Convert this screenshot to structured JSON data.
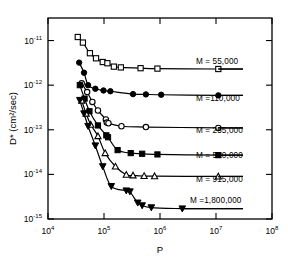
{
  "chart_data": {
    "type": "line",
    "title": "",
    "xlabel": "P",
    "ylabel": "D* (cm2/sec)",
    "ylabel_display": "D* (cm²/sec)",
    "xscale": "log",
    "yscale": "log",
    "xlim": [
      10000,
      100000000
    ],
    "ylim": [
      1e-15,
      3.2e-11
    ],
    "grid": false,
    "legend_position": "inline-right",
    "xticks": [
      {
        "value": 10000,
        "label": "10",
        "exponent": "4"
      },
      {
        "value": 100000,
        "label": "10",
        "exponent": "5"
      },
      {
        "value": 1000000,
        "label": "10",
        "exponent": "6"
      },
      {
        "value": 10000000,
        "label": "10",
        "exponent": "7"
      },
      {
        "value": 100000000,
        "label": "10",
        "exponent": "8"
      }
    ],
    "yticks": [
      {
        "value": 1e-11,
        "label": "10",
        "exponent": "-11"
      },
      {
        "value": 1e-12,
        "label": "10",
        "exponent": "-12"
      },
      {
        "value": 1e-13,
        "label": "10",
        "exponent": "-13"
      },
      {
        "value": 1e-14,
        "label": "10",
        "exponent": "-14"
      },
      {
        "value": 1e-15,
        "label": "10",
        "exponent": "-15"
      }
    ],
    "series": [
      {
        "name": "M = 55,000",
        "label": "M = 55,000",
        "marker": "square-open",
        "plateau": 2.3e-12,
        "label_x": 196,
        "label_y": 64,
        "leader_x1": 185,
        "leader_x2": 243,
        "leader_y": 72,
        "points": [
          {
            "x": 34000,
            "y": 1.2e-11
          },
          {
            "x": 42000,
            "y": 9e-12
          },
          {
            "x": 56000,
            "y": 5.2e-12
          },
          {
            "x": 72000,
            "y": 4e-12
          },
          {
            "x": 95000,
            "y": 3.3e-12
          },
          {
            "x": 115000,
            "y": 3.1e-12
          },
          {
            "x": 150000,
            "y": 2.6e-12
          },
          {
            "x": 200000,
            "y": 2.5e-12
          },
          {
            "x": 450000,
            "y": 2.4e-12
          },
          {
            "x": 900000,
            "y": 2.35e-12
          },
          {
            "x": 11000000,
            "y": 2.3e-12
          }
        ]
      },
      {
        "name": "M = 110,000",
        "label": "M =110,000",
        "marker": "circle-solid",
        "plateau": 6e-13,
        "label_x": 196,
        "label_y": 101,
        "leader_x1": 185,
        "leader_x2": 243,
        "leader_y": 109,
        "points": [
          {
            "x": 36000,
            "y": 3.2e-12
          },
          {
            "x": 44000,
            "y": 1.9e-12
          },
          {
            "x": 52000,
            "y": 1e-12
          },
          {
            "x": 70000,
            "y": 8.3e-13
          },
          {
            "x": 98000,
            "y": 7.6e-13
          },
          {
            "x": 130000,
            "y": 7.3e-13
          },
          {
            "x": 330000,
            "y": 6.3e-13
          },
          {
            "x": 560000,
            "y": 6.2e-13
          },
          {
            "x": 1050000,
            "y": 6.1e-13
          },
          {
            "x": 11000000,
            "y": 5.9e-13
          }
        ]
      },
      {
        "name": "M = 255,000",
        "label": "M = 255,000",
        "marker": "circle-open",
        "plateau": 1.1e-13,
        "label_x": 196,
        "label_y": 133,
        "leader_x1": 185,
        "leader_x2": 243,
        "leader_y": 141,
        "points": [
          {
            "x": 40000,
            "y": 1.1e-12
          },
          {
            "x": 50000,
            "y": 7e-13
          },
          {
            "x": 62000,
            "y": 4.2e-13
          },
          {
            "x": 78000,
            "y": 2.7e-13
          },
          {
            "x": 108000,
            "y": 1.7e-13
          },
          {
            "x": 112000,
            "y": 1.45e-13
          },
          {
            "x": 120000,
            "y": 1.4e-13
          },
          {
            "x": 205000,
            "y": 1.2e-13
          },
          {
            "x": 560000,
            "y": 1.15e-13
          },
          {
            "x": 11000000,
            "y": 1.1e-13
          }
        ]
      },
      {
        "name": "M = 520,000",
        "label": "M = 520,000",
        "marker": "square-solid",
        "plateau": 2.7e-14,
        "label_x": 196,
        "label_y": 158,
        "leader_x1": 185,
        "leader_x2": 243,
        "leader_y": 166,
        "points": [
          {
            "x": 37000,
            "y": 1e-12
          },
          {
            "x": 45000,
            "y": 5e-13
          },
          {
            "x": 55000,
            "y": 2.6e-13
          },
          {
            "x": 78000,
            "y": 1.25e-13
          },
          {
            "x": 110000,
            "y": 7.5e-14
          },
          {
            "x": 118000,
            "y": 6.8e-14
          },
          {
            "x": 175000,
            "y": 3.5e-14
          },
          {
            "x": 300000,
            "y": 3e-14
          },
          {
            "x": 480000,
            "y": 2.9e-14
          },
          {
            "x": 900000,
            "y": 2.8e-14
          },
          {
            "x": 11000000,
            "y": 2.7e-14
          }
        ]
      },
      {
        "name": "M = 915,000",
        "label": "M = 915,000",
        "marker": "triangle-open",
        "plateau": 9e-15,
        "label_x": 196,
        "label_y": 182,
        "leader_x1": 185,
        "leader_x2": 243,
        "leader_y": 190,
        "points": [
          {
            "x": 40000,
            "y": 4.5e-13
          },
          {
            "x": 48000,
            "y": 2.3e-13
          },
          {
            "x": 58000,
            "y": 1.3e-13
          },
          {
            "x": 78000,
            "y": 7.2e-14
          },
          {
            "x": 105000,
            "y": 3e-14
          },
          {
            "x": 160000,
            "y": 1.5e-14
          },
          {
            "x": 250000,
            "y": 9.8e-15
          },
          {
            "x": 330000,
            "y": 9.5e-15
          },
          {
            "x": 520000,
            "y": 9.2e-15
          },
          {
            "x": 800000,
            "y": 9.1e-15
          },
          {
            "x": 11000000,
            "y": 9e-15
          }
        ]
      },
      {
        "name": "M = 1,800,000",
        "label": "M =1,800,000",
        "marker": "triangle-solid",
        "plateau": 1.7e-15,
        "label_x": 190,
        "label_y": 203,
        "leader_x1": 150,
        "leader_x2": 243,
        "leader_y": 212,
        "points": [
          {
            "x": 37000,
            "y": 4.6e-13
          },
          {
            "x": 44000,
            "y": 2.3e-13
          },
          {
            "x": 52000,
            "y": 1.2e-13
          },
          {
            "x": 70000,
            "y": 4.4e-14
          },
          {
            "x": 95000,
            "y": 1.5e-14
          },
          {
            "x": 135000,
            "y": 5.4e-15
          },
          {
            "x": 250000,
            "y": 4.3e-15
          },
          {
            "x": 290000,
            "y": 4.1e-15
          },
          {
            "x": 400000,
            "y": 2.3e-15
          },
          {
            "x": 480000,
            "y": 2e-15
          },
          {
            "x": 700000,
            "y": 1.8e-15
          },
          {
            "x": 2500000,
            "y": 1.7e-15
          }
        ]
      }
    ]
  }
}
